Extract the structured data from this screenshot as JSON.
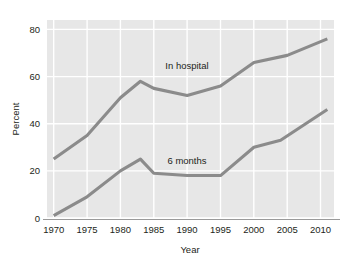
{
  "chart_data": {
    "type": "line",
    "title": "",
    "xlabel": "Year",
    "ylabel": "Percent",
    "xlim": [
      1969,
      2012
    ],
    "ylim": [
      0,
      84
    ],
    "grid": true,
    "legend_position": "inline-annotation",
    "x_ticks": [
      1970,
      1975,
      1980,
      1985,
      1990,
      1995,
      2000,
      2005,
      2010
    ],
    "x_tick_labels": [
      "1970",
      "1975",
      "1980",
      "1985",
      "1990",
      "1995",
      "2000",
      "2005",
      "2010"
    ],
    "y_ticks": [
      0,
      20,
      40,
      60,
      80
    ],
    "y_tick_labels": [
      "0",
      "20",
      "40",
      "60",
      "80"
    ],
    "series": [
      {
        "name": "In hospital",
        "color": "#8b8b8b",
        "label_text": "In hospital",
        "x": [
          1970,
          1975,
          1980,
          1983,
          1985,
          1990,
          1995,
          2000,
          2005,
          2011
        ],
        "values": [
          25,
          35,
          51,
          58,
          55,
          52,
          56,
          66,
          69,
          76
        ]
      },
      {
        "name": "6 months",
        "color": "#8b8b8b",
        "label_text": "6 months",
        "x": [
          1970,
          1975,
          1980,
          1983,
          1985,
          1990,
          1995,
          2000,
          2004,
          2011
        ],
        "values": [
          1,
          9,
          20,
          25,
          19,
          18,
          18,
          30,
          33,
          46
        ]
      }
    ],
    "annotations": [
      {
        "text": "In hospital",
        "x": 1989,
        "y": 62
      },
      {
        "text": "6 months",
        "x": 1989,
        "y": 22
      }
    ]
  },
  "colors": {
    "panel_background": "#e7e7e7",
    "gridline": "#ffffff",
    "line": "#8b8b8b",
    "text": "#231f20",
    "axis": "#9a9a9a",
    "page_background": "#ffffff"
  }
}
